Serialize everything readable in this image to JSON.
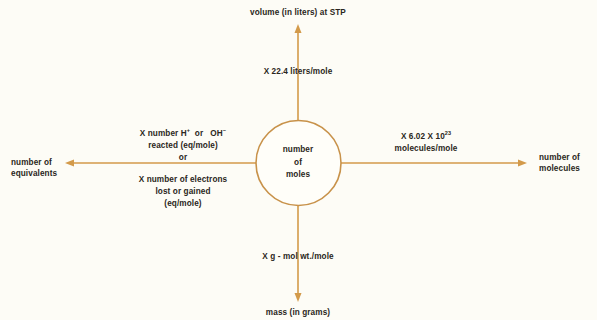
{
  "diagram": {
    "colors": {
      "background": "#fdfcf6",
      "line": "#d39a4a",
      "circle": "#c8924a",
      "text": "#2a2620"
    },
    "center": {
      "line1": "number",
      "line2": "of",
      "line3": "moles"
    },
    "top": {
      "target": "volume  (in liters) at STP",
      "factor": "X 22.4 liters/mole"
    },
    "right": {
      "target_line1": "number of",
      "target_line2": "molecules",
      "factor_prefix": "X 6.02 X 10",
      "factor_exponent": "23",
      "factor_line2": "molecules/mole"
    },
    "bottom": {
      "target": "mass (in grams)",
      "factor": "X g -  mol wt./mole"
    },
    "left": {
      "target_line1": "number of",
      "target_line2": "equivalents",
      "factor_a_prefix": "X number H",
      "factor_a_sup1": "+",
      "factor_a_mid": "  or   OH",
      "factor_a_sup2": "−",
      "factor_a_line2": "reacted (eq/mole)",
      "or_label": "or",
      "factor_b_line1": "X number of electrons",
      "factor_b_line2": "lost or gained",
      "factor_b_line3": "(eq/mole)"
    }
  }
}
